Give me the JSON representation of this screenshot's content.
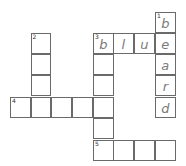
{
  "puzzle": {
    "type": "crossword",
    "cell_size": 20.7,
    "origin": {
      "x": 10,
      "y": 12
    },
    "cells": [
      {
        "row": 0,
        "col": 7,
        "number": "1",
        "letter": "b"
      },
      {
        "row": 1,
        "col": 7,
        "number": "",
        "letter": "e"
      },
      {
        "row": 2,
        "col": 7,
        "number": "",
        "letter": "a"
      },
      {
        "row": 3,
        "col": 7,
        "number": "",
        "letter": "r"
      },
      {
        "row": 4,
        "col": 7,
        "number": "",
        "letter": "d"
      },
      {
        "row": 1,
        "col": 4,
        "number": "3",
        "letter": "b"
      },
      {
        "row": 1,
        "col": 5,
        "number": "",
        "letter": "l"
      },
      {
        "row": 1,
        "col": 6,
        "number": "",
        "letter": "u"
      },
      {
        "row": 2,
        "col": 4,
        "number": "",
        "letter": ""
      },
      {
        "row": 3,
        "col": 4,
        "number": "",
        "letter": ""
      },
      {
        "row": 4,
        "col": 4,
        "number": "",
        "letter": ""
      },
      {
        "row": 5,
        "col": 4,
        "number": "",
        "letter": ""
      },
      {
        "row": 1,
        "col": 1,
        "number": "2",
        "letter": ""
      },
      {
        "row": 2,
        "col": 1,
        "number": "",
        "letter": ""
      },
      {
        "row": 3,
        "col": 1,
        "number": "",
        "letter": ""
      },
      {
        "row": 4,
        "col": 0,
        "number": "4",
        "letter": ""
      },
      {
        "row": 4,
        "col": 1,
        "number": "",
        "letter": ""
      },
      {
        "row": 4,
        "col": 2,
        "number": "",
        "letter": ""
      },
      {
        "row": 4,
        "col": 3,
        "number": "",
        "letter": ""
      },
      {
        "row": 6,
        "col": 4,
        "number": "5",
        "letter": ""
      },
      {
        "row": 6,
        "col": 5,
        "number": "",
        "letter": ""
      },
      {
        "row": 6,
        "col": 6,
        "number": "",
        "letter": ""
      },
      {
        "row": 6,
        "col": 7,
        "number": "",
        "letter": ""
      }
    ],
    "words": [
      {
        "number": "1",
        "direction": "down",
        "answer_shown": "beard"
      },
      {
        "number": "2",
        "direction": "down",
        "answer_shown": ""
      },
      {
        "number": "3",
        "direction": "across",
        "answer_shown": "blue"
      },
      {
        "number": "3",
        "direction": "down",
        "answer_shown": "b"
      },
      {
        "number": "4",
        "direction": "across",
        "answer_shown": ""
      },
      {
        "number": "5",
        "direction": "across",
        "answer_shown": ""
      }
    ]
  }
}
